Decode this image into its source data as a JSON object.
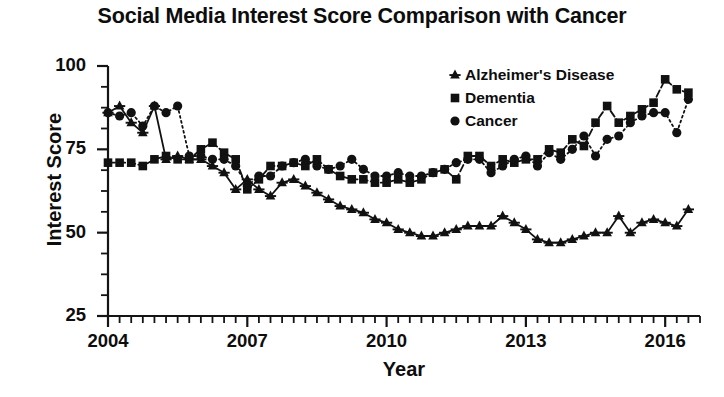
{
  "chart_data": {
    "type": "line",
    "title": "Social Media Interest Score Comparison with Cancer",
    "xlabel": "Year",
    "ylabel": "Interest Score",
    "xlim": [
      2004,
      2016.75
    ],
    "ylim": [
      25,
      100
    ],
    "grid": false,
    "legend_position": "top-right",
    "x_ticks": [
      2004,
      2007,
      2010,
      2013,
      2016
    ],
    "x_tick_labels": [
      "2004",
      "2007",
      "2010",
      "2013",
      "2016"
    ],
    "x_minor_tick_interval": 0.25,
    "y_ticks": [
      25,
      50,
      75,
      100
    ],
    "y_tick_labels": [
      "25",
      "50",
      "75",
      "100"
    ],
    "y_minor_tick_interval": 6.25,
    "x": [
      2004.0,
      2004.25,
      2004.5,
      2004.75,
      2005.0,
      2005.25,
      2005.5,
      2005.75,
      2006.0,
      2006.25,
      2006.5,
      2006.75,
      2007.0,
      2007.25,
      2007.5,
      2007.75,
      2008.0,
      2008.25,
      2008.5,
      2008.75,
      2009.0,
      2009.25,
      2009.5,
      2009.75,
      2010.0,
      2010.25,
      2010.5,
      2010.75,
      2011.0,
      2011.25,
      2011.5,
      2011.75,
      2012.0,
      2012.25,
      2012.5,
      2012.75,
      2013.0,
      2013.25,
      2013.5,
      2013.75,
      2014.0,
      2014.25,
      2014.5,
      2014.75,
      2015.0,
      2015.25,
      2015.5,
      2015.75,
      2016.0,
      2016.25,
      2016.5
    ],
    "series": [
      {
        "name": "Alzheimer's Disease",
        "marker": "triangle",
        "linestyle": "solid",
        "color": "#111111",
        "values": [
          86,
          88,
          83,
          80,
          88,
          72,
          73,
          72,
          72,
          70,
          68,
          63,
          66,
          63,
          61,
          65,
          66,
          64,
          62,
          60,
          58,
          57,
          56,
          54,
          53,
          51,
          50,
          49,
          49,
          50,
          51,
          52,
          52,
          52,
          55,
          53,
          51,
          48,
          47,
          47,
          48,
          49,
          50,
          50,
          55,
          50,
          53,
          54,
          53,
          52,
          57
        ]
      },
      {
        "name": "Dementia",
        "marker": "square",
        "linestyle": "dashed",
        "color": "#111111",
        "values": [
          71,
          71,
          71,
          70,
          72,
          73,
          72,
          72,
          75,
          77,
          74,
          72,
          63,
          66,
          70,
          70,
          71,
          70,
          72,
          69,
          67,
          66,
          66,
          65,
          65,
          66,
          65,
          66,
          68,
          69,
          66,
          73,
          73,
          70,
          72,
          71,
          72,
          72,
          75,
          74,
          78,
          76,
          83,
          88,
          83,
          85,
          87,
          89,
          96,
          93,
          92
        ]
      },
      {
        "name": "Cancer",
        "marker": "circle",
        "linestyle": "dotted",
        "color": "#111111",
        "values": [
          86,
          85,
          86,
          82,
          88,
          86,
          88,
          73,
          73,
          72,
          72,
          70,
          64,
          67,
          67,
          70,
          71,
          72,
          70,
          69,
          70,
          72,
          69,
          67,
          67,
          68,
          67,
          67,
          68,
          69,
          71,
          72,
          72,
          68,
          70,
          72,
          73,
          70,
          74,
          72,
          75,
          79,
          73,
          78,
          79,
          83,
          85,
          86,
          86,
          80,
          90
        ]
      }
    ]
  }
}
